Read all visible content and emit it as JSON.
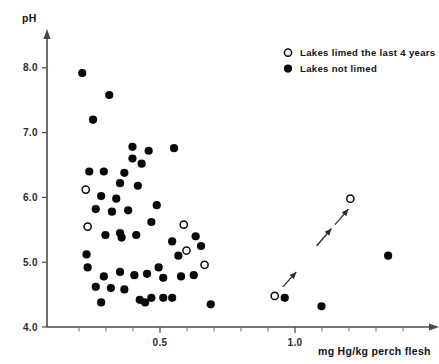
{
  "chart_data": {
    "type": "scatter",
    "title": "",
    "xlabel": "mg Hg/kg  perch flesh",
    "ylabel": "pH",
    "xlim": [
      0.1,
      1.45
    ],
    "ylim": [
      4.0,
      8.35
    ],
    "grid": false,
    "x_major_ticks": [
      0.5,
      1.0
    ],
    "x_major_tick_labels": [
      "0.5",
      "1.0"
    ],
    "x_minor_ticks": [
      0.2,
      0.3,
      0.4,
      0.6,
      0.7,
      0.8,
      0.9,
      1.1,
      1.2,
      1.3,
      1.4
    ],
    "y_major_ticks": [
      4.0,
      5.0,
      6.0,
      7.0,
      8.0
    ],
    "y_major_tick_labels": [
      "4.0",
      "5.0",
      "6.0",
      "7.0",
      "8.0"
    ],
    "legend_position": "top-right",
    "series": [
      {
        "name": "Lakes limed the last 4 years",
        "marker": "open-circle",
        "color": "#080808",
        "points": [
          {
            "x": 0.225,
            "y": 6.12
          },
          {
            "x": 0.232,
            "y": 5.55
          },
          {
            "x": 0.588,
            "y": 5.58
          },
          {
            "x": 0.598,
            "y": 5.18
          },
          {
            "x": 0.665,
            "y": 4.96
          },
          {
            "x": 0.925,
            "y": 4.48
          },
          {
            "x": 1.205,
            "y": 5.98
          }
        ]
      },
      {
        "name": "Lakes not limed",
        "marker": "filled-circle",
        "color": "#080808",
        "points": [
          {
            "x": 0.212,
            "y": 7.92
          },
          {
            "x": 0.312,
            "y": 7.58
          },
          {
            "x": 0.252,
            "y": 7.2
          },
          {
            "x": 0.398,
            "y": 6.78
          },
          {
            "x": 0.398,
            "y": 6.6
          },
          {
            "x": 0.458,
            "y": 6.72
          },
          {
            "x": 0.552,
            "y": 6.76
          },
          {
            "x": 0.238,
            "y": 6.4
          },
          {
            "x": 0.292,
            "y": 6.4
          },
          {
            "x": 0.368,
            "y": 6.38
          },
          {
            "x": 0.432,
            "y": 6.52
          },
          {
            "x": 0.352,
            "y": 6.22
          },
          {
            "x": 0.418,
            "y": 6.18
          },
          {
            "x": 0.282,
            "y": 6.02
          },
          {
            "x": 0.338,
            "y": 5.98
          },
          {
            "x": 0.262,
            "y": 5.82
          },
          {
            "x": 0.322,
            "y": 5.78
          },
          {
            "x": 0.382,
            "y": 5.8
          },
          {
            "x": 0.488,
            "y": 5.88
          },
          {
            "x": 0.468,
            "y": 5.62
          },
          {
            "x": 0.352,
            "y": 5.45
          },
          {
            "x": 0.358,
            "y": 5.38
          },
          {
            "x": 0.298,
            "y": 5.42
          },
          {
            "x": 0.412,
            "y": 5.42
          },
          {
            "x": 0.545,
            "y": 5.32
          },
          {
            "x": 0.568,
            "y": 5.1
          },
          {
            "x": 0.632,
            "y": 5.4
          },
          {
            "x": 0.652,
            "y": 5.25
          },
          {
            "x": 0.228,
            "y": 5.12
          },
          {
            "x": 0.232,
            "y": 4.92
          },
          {
            "x": 0.292,
            "y": 4.78
          },
          {
            "x": 0.352,
            "y": 4.85
          },
          {
            "x": 0.405,
            "y": 4.8
          },
          {
            "x": 0.452,
            "y": 4.82
          },
          {
            "x": 0.495,
            "y": 4.92
          },
          {
            "x": 0.512,
            "y": 4.76
          },
          {
            "x": 0.578,
            "y": 4.78
          },
          {
            "x": 0.625,
            "y": 4.8
          },
          {
            "x": 0.262,
            "y": 4.62
          },
          {
            "x": 0.318,
            "y": 4.6
          },
          {
            "x": 0.368,
            "y": 4.58
          },
          {
            "x": 0.425,
            "y": 4.42
          },
          {
            "x": 0.468,
            "y": 4.45
          },
          {
            "x": 0.512,
            "y": 4.45
          },
          {
            "x": 0.545,
            "y": 4.45
          },
          {
            "x": 0.282,
            "y": 4.38
          },
          {
            "x": 0.445,
            "y": 4.38
          },
          {
            "x": 0.688,
            "y": 4.35
          },
          {
            "x": 0.962,
            "y": 4.45
          },
          {
            "x": 1.098,
            "y": 4.32
          },
          {
            "x": 1.345,
            "y": 5.1
          }
        ]
      }
    ],
    "annotations": [
      {
        "type": "arrow",
        "x1": 0.955,
        "y1": 4.62,
        "x2": 1.005,
        "y2": 4.85
      },
      {
        "type": "arrow",
        "x1": 1.08,
        "y1": 5.25,
        "x2": 1.135,
        "y2": 5.52
      },
      {
        "type": "arrow",
        "x1": 1.148,
        "y1": 5.58,
        "x2": 1.198,
        "y2": 5.82
      }
    ]
  },
  "legend": {
    "items": [
      {
        "label": "Lakes limed the last 4 years",
        "marker": "open-circle"
      },
      {
        "label": "Lakes not limed",
        "marker": "filled-circle"
      }
    ]
  }
}
